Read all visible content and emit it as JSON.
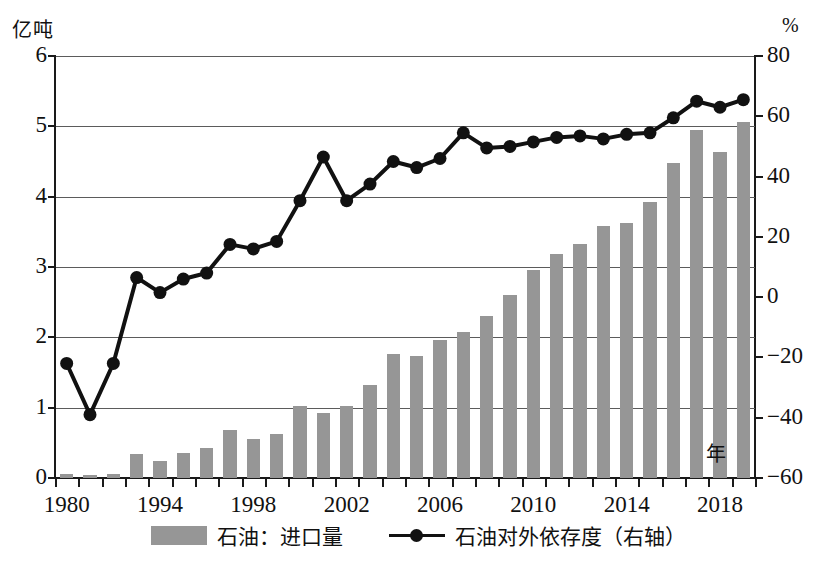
{
  "axis_units": {
    "left": "亿吨",
    "right": "%",
    "x": "年"
  },
  "legend": [
    {
      "type": "bar",
      "label": "石油：进口量",
      "color": "#969696"
    },
    {
      "type": "line",
      "label": "石油对外依存度（右轴）",
      "color": "#111111"
    }
  ],
  "chart_data": {
    "type": "bar",
    "title": "",
    "subtitle": "",
    "xlabel": "年",
    "ylabel": "亿吨",
    "y2label": "%",
    "ylim": [
      0,
      6
    ],
    "y2lim": [
      -60,
      80
    ],
    "grid": true,
    "legend_position": "bottom",
    "categories": [
      "1980",
      "1985",
      "1990",
      "1993",
      "1994",
      "1995",
      "1996",
      "1997",
      "1998",
      "1999",
      "2000",
      "2001",
      "2002",
      "2003",
      "2004",
      "2005",
      "2006",
      "2007",
      "2008",
      "2009",
      "2010",
      "2011",
      "2012",
      "2013",
      "2014",
      "2015",
      "2016",
      "2017",
      "2018",
      "2019"
    ],
    "x_tick_labels": [
      "1980",
      "1994",
      "1998",
      "2002",
      "2006",
      "2010",
      "2014",
      "2018"
    ],
    "x_tick_label_indices": [
      0,
      4,
      8,
      12,
      16,
      20,
      24,
      28
    ],
    "y_tick_labels": [
      "0",
      "1",
      "2",
      "3",
      "4",
      "5",
      "6"
    ],
    "y2_tick_labels": [
      "-60",
      "-40",
      "-20",
      "0",
      "20",
      "40",
      "60",
      "80"
    ],
    "series": [
      {
        "name": "石油：进口量",
        "axis": "left",
        "kind": "bar",
        "unit": "亿吨",
        "values": [
          0.05,
          0.04,
          0.06,
          0.34,
          0.24,
          0.35,
          0.43,
          0.68,
          0.56,
          0.63,
          1.03,
          0.92,
          1.03,
          1.32,
          1.76,
          1.73,
          1.96,
          2.08,
          2.31,
          2.6,
          2.96,
          3.19,
          3.33,
          3.58,
          3.63,
          3.93,
          4.48,
          4.95,
          4.63,
          5.06
        ]
      },
      {
        "name": "石油对外依存度（右轴）",
        "axis": "right",
        "kind": "line",
        "unit": "%",
        "values": [
          -22.0,
          -39.0,
          -22.0,
          6.5,
          1.5,
          6.0,
          8.0,
          17.5,
          16.0,
          18.5,
          32.0,
          46.5,
          32.0,
          37.5,
          45.0,
          43.0,
          46.0,
          54.5,
          49.5,
          50.0,
          51.5,
          53.0,
          53.5,
          52.5,
          54.0,
          54.5,
          59.5,
          65.0,
          63.0,
          65.5
        ]
      }
    ]
  }
}
